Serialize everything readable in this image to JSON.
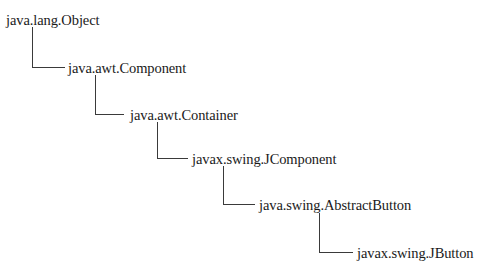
{
  "diagram": {
    "type": "class-hierarchy",
    "nodes": [
      {
        "id": "n0",
        "label": "java.lang.Object"
      },
      {
        "id": "n1",
        "label": "java.awt.Component"
      },
      {
        "id": "n2",
        "label": "java.awt.Container"
      },
      {
        "id": "n3",
        "label": "javax.swing.JComponent"
      },
      {
        "id": "n4",
        "label": "java.swing.AbstractButton"
      },
      {
        "id": "n5",
        "label": "javax.swing.JButton"
      }
    ],
    "edges": [
      {
        "from": "n0",
        "to": "n1"
      },
      {
        "from": "n1",
        "to": "n2"
      },
      {
        "from": "n2",
        "to": "n3"
      },
      {
        "from": "n3",
        "to": "n4"
      },
      {
        "from": "n4",
        "to": "n5"
      }
    ],
    "colors": {
      "text": "#1a1a1a",
      "connector": "#3a3a3a",
      "background": "#ffffff"
    }
  }
}
